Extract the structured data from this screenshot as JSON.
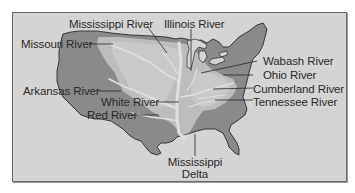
{
  "map": {
    "subject": "Mississippi River drainage basin (United States)",
    "colors": {
      "background": "#d4d4d4",
      "land": "#8a8a8a",
      "basin": "#bdbdbd",
      "sub_basin": "#c9c9c9",
      "rivers": "#e0e0e0",
      "outline": "#2a2a2a",
      "text": "#2a2a2a"
    },
    "labels": {
      "mississippi_river": "Mississippi River",
      "illinois_river": "Illinois River",
      "missouri_river": "Missouri River",
      "wabash_river": "Wabash River",
      "ohio_river": "Ohio River",
      "arkansas_river": "Arkansas River",
      "cumberland_river": "Cumberland River",
      "white_river": "White River",
      "tennessee_river": "Tennessee River",
      "red_river": "Red River",
      "mississippi_delta_line1": "Mississippi",
      "mississippi_delta_line2": "Delta"
    }
  }
}
